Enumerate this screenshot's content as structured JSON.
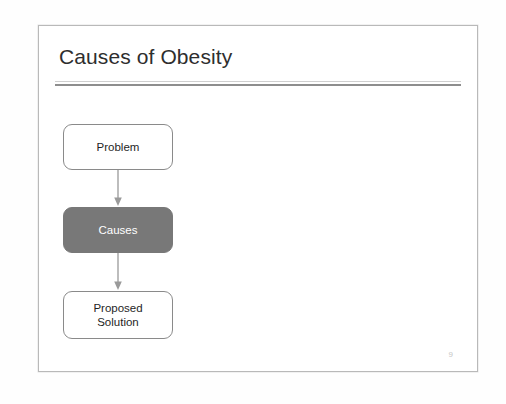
{
  "slide": {
    "title": "Causes of Obesity",
    "page_number": "9",
    "accent_fill": "#787878",
    "border_color": "#8a8a8a",
    "title_color": "#2e2e2e",
    "rule_thin_color": "#cfcfcf",
    "rule_thick_color": "#8e8e8e"
  },
  "flowchart": {
    "nodes": [
      {
        "label": "Problem",
        "style": "outline"
      },
      {
        "label": "Causes",
        "style": "filled"
      },
      {
        "label": "Proposed\nSolution",
        "style": "outline"
      }
    ],
    "connectors": [
      {
        "from": "Problem",
        "to": "Causes",
        "arrow": "down-arrow"
      },
      {
        "from": "Causes",
        "to": "Proposed Solution",
        "arrow": "down-arrow"
      }
    ]
  }
}
